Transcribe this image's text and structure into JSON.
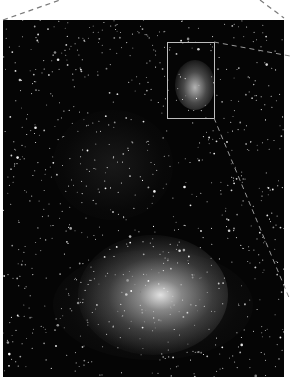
{
  "image": {
    "description": "Astronomical starfield photograph (grayscale) showing a large bright nebula in the lower half and a smaller nebula inside a highlighted rectangle at upper right",
    "highlight_box": {
      "x": 167,
      "y": 42,
      "width": 47,
      "height": 76
    },
    "connector_lines": "dashed lines from top corners and from highlight box corner toward right edge",
    "colors": {
      "background": "#050505",
      "frame": "#ffffff",
      "box_outline": "#bdbdbd",
      "dash": "#7a7a7a"
    }
  }
}
